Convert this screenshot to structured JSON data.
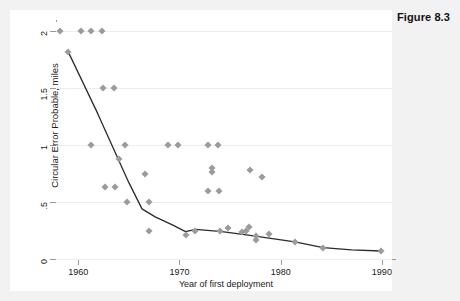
{
  "figure": {
    "caption": "Figure 8.3"
  },
  "chart_data": {
    "type": "scatter",
    "title": "",
    "xlabel": "Year of first deployment",
    "ylabel": "Circular Error Probable, miles",
    "xlim": [
      1957.8,
      1991.0
    ],
    "ylim": [
      0,
      2.08
    ],
    "xticks": [
      1960,
      1970,
      1980,
      1990
    ],
    "xticklabels": [
      "1960",
      "1970",
      "1980",
      "1990"
    ],
    "yticks": [
      0,
      0.5,
      1,
      1.5,
      2
    ],
    "yticklabels": [
      "0",
      ".5",
      "1",
      "1.5",
      "2"
    ],
    "grid": "horizontal",
    "legend": "none",
    "marker": "diamond",
    "marker_color": "#9b9b9b",
    "line_color": "#2b2b2b",
    "points": [
      {
        "x": 1958.2,
        "y": 2.0
      },
      {
        "x": 1960.3,
        "y": 2.0
      },
      {
        "x": 1961.3,
        "y": 2.0
      },
      {
        "x": 1962.3,
        "y": 2.0
      },
      {
        "x": 1959.0,
        "y": 1.82
      },
      {
        "x": 1962.4,
        "y": 1.5
      },
      {
        "x": 1963.5,
        "y": 1.5
      },
      {
        "x": 1961.3,
        "y": 1.0
      },
      {
        "x": 1964.6,
        "y": 1.0
      },
      {
        "x": 1968.9,
        "y": 1.0
      },
      {
        "x": 1969.9,
        "y": 1.0
      },
      {
        "x": 1972.8,
        "y": 1.0
      },
      {
        "x": 1973.8,
        "y": 1.0
      },
      {
        "x": 1964.0,
        "y": 0.88
      },
      {
        "x": 1966.6,
        "y": 0.75
      },
      {
        "x": 1973.2,
        "y": 0.8
      },
      {
        "x": 1973.2,
        "y": 0.76
      },
      {
        "x": 1977.0,
        "y": 0.78
      },
      {
        "x": 1978.2,
        "y": 0.72
      },
      {
        "x": 1962.6,
        "y": 0.63
      },
      {
        "x": 1963.6,
        "y": 0.63
      },
      {
        "x": 1972.8,
        "y": 0.6
      },
      {
        "x": 1973.9,
        "y": 0.6
      },
      {
        "x": 1964.8,
        "y": 0.5
      },
      {
        "x": 1967.0,
        "y": 0.5
      },
      {
        "x": 1967.0,
        "y": 0.25
      },
      {
        "x": 1970.6,
        "y": 0.21
      },
      {
        "x": 1971.5,
        "y": 0.25
      },
      {
        "x": 1974.0,
        "y": 0.25
      },
      {
        "x": 1974.8,
        "y": 0.27
      },
      {
        "x": 1976.2,
        "y": 0.24
      },
      {
        "x": 1976.6,
        "y": 0.25
      },
      {
        "x": 1976.9,
        "y": 0.28
      },
      {
        "x": 1977.6,
        "y": 0.2
      },
      {
        "x": 1977.6,
        "y": 0.17
      },
      {
        "x": 1978.8,
        "y": 0.22
      },
      {
        "x": 1981.4,
        "y": 0.15
      },
      {
        "x": 1984.2,
        "y": 0.1
      },
      {
        "x": 1989.9,
        "y": 0.07
      }
    ],
    "trend_line": [
      {
        "x": 1959.0,
        "y": 1.82
      },
      {
        "x": 1961.8,
        "y": 1.3
      },
      {
        "x": 1962.1,
        "y": 1.24
      },
      {
        "x": 1965.0,
        "y": 0.67
      },
      {
        "x": 1966.3,
        "y": 0.44
      },
      {
        "x": 1967.6,
        "y": 0.37
      },
      {
        "x": 1969.3,
        "y": 0.3
      },
      {
        "x": 1970.6,
        "y": 0.24
      },
      {
        "x": 1971.6,
        "y": 0.26
      },
      {
        "x": 1974.2,
        "y": 0.24
      },
      {
        "x": 1976.8,
        "y": 0.21
      },
      {
        "x": 1981.4,
        "y": 0.15
      },
      {
        "x": 1984.2,
        "y": 0.1
      },
      {
        "x": 1987.0,
        "y": 0.08
      },
      {
        "x": 1989.9,
        "y": 0.07
      }
    ]
  }
}
